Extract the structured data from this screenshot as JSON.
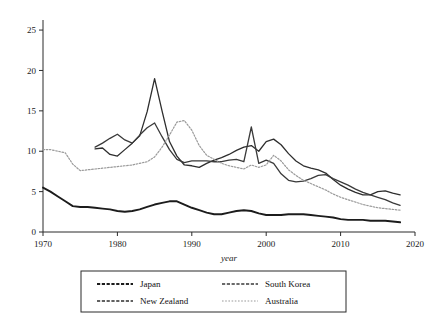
{
  "chart_data": {
    "type": "line",
    "title": "",
    "xlabel": "year",
    "ylabel": "",
    "xlim": [
      1970,
      2020
    ],
    "ylim": [
      0,
      26
    ],
    "xticks": [
      1970,
      1980,
      1990,
      2000,
      2010,
      2020
    ],
    "yticks": [
      0,
      5,
      10,
      15,
      20,
      25
    ],
    "grid": false,
    "legend_position": "below",
    "x": [
      1970,
      1971,
      1972,
      1973,
      1974,
      1975,
      1976,
      1977,
      1978,
      1979,
      1980,
      1981,
      1982,
      1983,
      1984,
      1985,
      1986,
      1987,
      1988,
      1989,
      1990,
      1991,
      1992,
      1993,
      1994,
      1995,
      1996,
      1997,
      1998,
      1999,
      2000,
      2001,
      2002,
      2003,
      2004,
      2005,
      2006,
      2007,
      2008,
      2009,
      2010,
      2011,
      2012,
      2013,
      2014,
      2015,
      2016,
      2017,
      2018
    ],
    "series": [
      {
        "name": "Japan",
        "color": "#1c1c1c",
        "width": 1.9,
        "dash": "",
        "start_year": 1970,
        "values": [
          5.5,
          5.0,
          4.4,
          3.8,
          3.2,
          3.1,
          3.1,
          3.0,
          2.9,
          2.8,
          2.6,
          2.5,
          2.6,
          2.8,
          3.1,
          3.4,
          3.6,
          3.8,
          3.8,
          3.4,
          3.0,
          2.7,
          2.4,
          2.2,
          2.2,
          2.4,
          2.6,
          2.7,
          2.6,
          2.3,
          2.1,
          2.1,
          2.1,
          2.2,
          2.2,
          2.2,
          2.1,
          2.0,
          1.9,
          1.8,
          1.6,
          1.5,
          1.5,
          1.5,
          1.4,
          1.4,
          1.4,
          1.3,
          1.2
        ]
      },
      {
        "name": "New Zealand",
        "color": "#2e2e2e",
        "width": 1.3,
        "dash": "",
        "start_year": 1977,
        "values": [
          null,
          null,
          null,
          null,
          null,
          null,
          null,
          10.3,
          10.4,
          9.6,
          9.4,
          10.2,
          11.0,
          11.9,
          14.9,
          19.0,
          15.0,
          11.2,
          9.4,
          8.3,
          8.2,
          8.0,
          8.5,
          8.9,
          9.2,
          9.6,
          10.1,
          10.5,
          10.7,
          10.0,
          11.2,
          11.5,
          10.8,
          9.7,
          8.8,
          8.2,
          7.9,
          7.7,
          7.3,
          6.5,
          5.8,
          5.3,
          4.9,
          4.6,
          4.6,
          5.0,
          5.1,
          4.8,
          4.6
        ]
      },
      {
        "name": "South Korea",
        "color": "#3a3a3a",
        "width": 1.3,
        "dash": "",
        "start_year": 1977,
        "values": [
          null,
          null,
          null,
          null,
          null,
          null,
          null,
          10.5,
          11.0,
          11.6,
          12.1,
          11.4,
          11.0,
          12.0,
          12.9,
          13.5,
          11.8,
          10.2,
          9.0,
          8.6,
          8.8,
          8.8,
          8.8,
          8.7,
          8.7,
          8.9,
          9.0,
          8.7,
          13.0,
          8.5,
          8.9,
          8.5,
          7.2,
          6.4,
          6.2,
          6.3,
          6.6,
          7.0,
          7.1,
          6.6,
          6.2,
          5.8,
          5.3,
          4.9,
          4.6,
          4.3,
          4.0,
          3.6,
          3.3
        ]
      },
      {
        "name": "Australia",
        "color": "#9a9a9a",
        "width": 1.2,
        "dash": "1.6 1.6",
        "start_year": 1970,
        "values": [
          10.2,
          10.2,
          10.0,
          9.8,
          8.4,
          7.6,
          7.7,
          7.8,
          7.9,
          8.0,
          8.1,
          8.2,
          8.3,
          8.5,
          8.7,
          9.3,
          10.5,
          12.0,
          13.6,
          13.8,
          12.6,
          10.7,
          9.5,
          9.0,
          8.5,
          8.2,
          8.0,
          7.8,
          8.3,
          8.0,
          8.3,
          9.5,
          8.8,
          7.7,
          7.0,
          6.4,
          6.0,
          5.6,
          5.2,
          4.7,
          4.3,
          4.0,
          3.7,
          3.4,
          3.2,
          3.0,
          2.9,
          2.8,
          2.7
        ]
      }
    ]
  },
  "legend": {
    "entries": [
      {
        "label": "Japan"
      },
      {
        "label": "South Korea"
      },
      {
        "label": "New Zealand"
      },
      {
        "label": "Australia"
      }
    ]
  },
  "axes": {
    "x_title": "year",
    "x_tick_labels": [
      "1970",
      "1980",
      "1990",
      "2000",
      "2010",
      "2020"
    ],
    "y_tick_labels": [
      "0",
      "5",
      "10",
      "15",
      "20",
      "25"
    ]
  }
}
